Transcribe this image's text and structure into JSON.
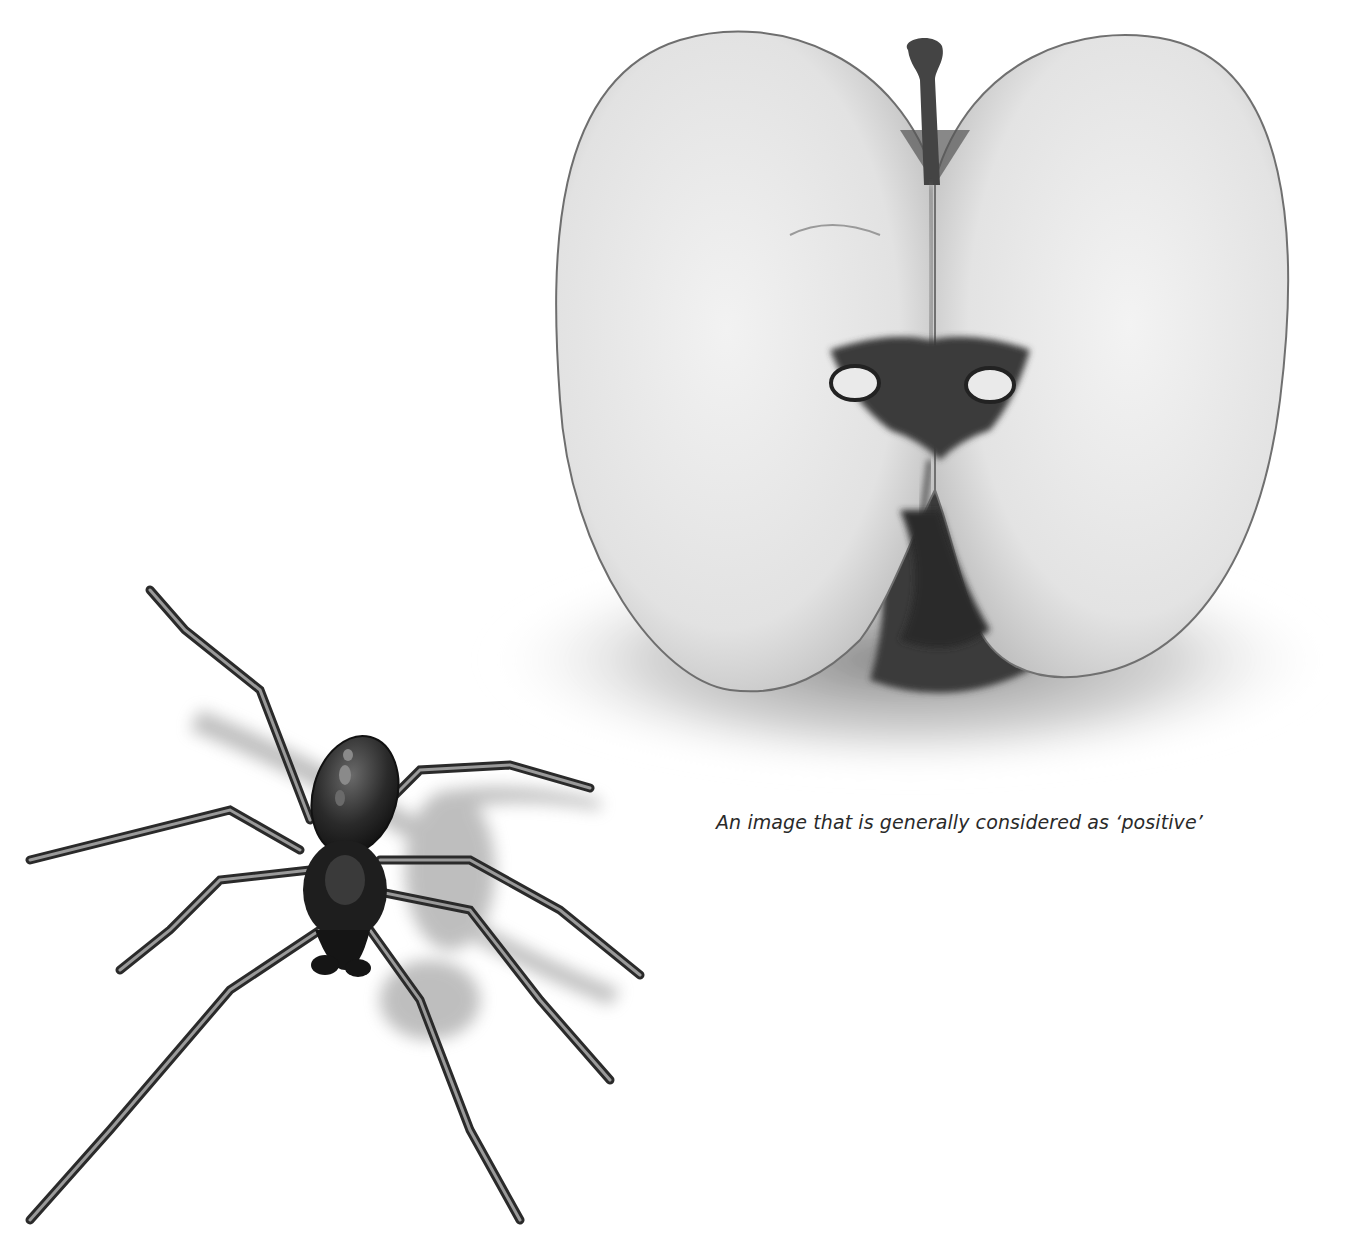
{
  "page": {
    "images": [
      {
        "id": "apple",
        "subject": "halved apple cross-section (black and white photograph)",
        "tone": "grayscale"
      },
      {
        "id": "spider",
        "subject": "spider illustration (black and white)",
        "tone": "grayscale"
      }
    ],
    "caption": "An image that is generally considered as ‘positive’"
  },
  "colors": {
    "background": "#ffffff",
    "apple_flesh": "#e6e6e6",
    "apple_edge": "#7a7a7a",
    "core_dark": "#2b2b2b",
    "spider_body": "#1c1c1c",
    "shadow": "#9a9a9a",
    "caption_text": "#2a2a2a"
  }
}
